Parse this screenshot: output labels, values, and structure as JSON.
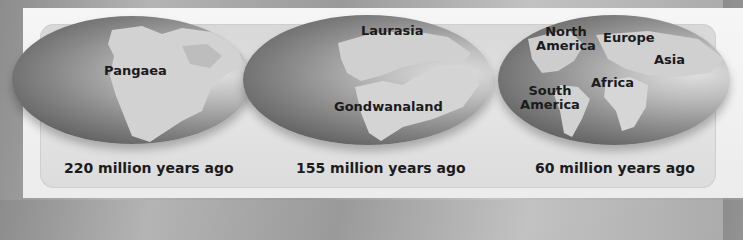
{
  "figure": {
    "panels": [
      {
        "caption": "220 million years ago",
        "labels": [
          "Pangaea"
        ]
      },
      {
        "caption": "155 million years ago",
        "labels": [
          "Laurasia",
          "Gondwanaland"
        ]
      },
      {
        "caption": "60 million years ago",
        "labels": [
          "North",
          "America",
          "Europe",
          "Asia",
          "Africa",
          "South",
          "America"
        ]
      }
    ]
  },
  "colors": {
    "ocean_dark": "#4a4a4a",
    "ocean_light": "#e0e0e0",
    "land": "#d4d4d4",
    "text": "#1b1b1b",
    "panel": "#dcdcdc",
    "frame": "#f2f2f2",
    "background": "#a4a4a4"
  }
}
